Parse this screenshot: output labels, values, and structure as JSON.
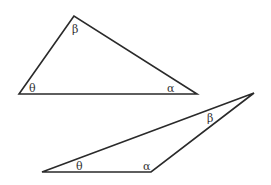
{
  "diagram": {
    "type": "geometry",
    "line_color": "#2a2a2a",
    "triangles": [
      {
        "id": "triangle-1",
        "vertices": {
          "top": [
            74,
            16
          ],
          "left": [
            19,
            94
          ],
          "right": [
            197,
            94
          ]
        },
        "angles": {
          "beta": {
            "symbol": "β",
            "at": "top",
            "label_pos": [
              72,
              33
            ]
          },
          "theta": {
            "symbol": "θ",
            "at": "left",
            "label_pos": [
              29,
              92
            ]
          },
          "alpha": {
            "symbol": "α",
            "at": "right",
            "label_pos": [
              167,
              92
            ]
          }
        }
      },
      {
        "id": "triangle-2",
        "vertices": {
          "top_right": [
            254,
            93
          ],
          "left": [
            42,
            172
          ],
          "right": [
            151,
            172
          ]
        },
        "angles": {
          "beta": {
            "symbol": "β",
            "at": "top_right",
            "label_pos": [
              207,
              122
            ]
          },
          "theta": {
            "symbol": "θ",
            "at": "left",
            "label_pos": [
              76,
              170
            ]
          },
          "alpha": {
            "symbol": "α",
            "at": "right",
            "label_pos": [
              143,
              170
            ]
          }
        }
      }
    ]
  }
}
